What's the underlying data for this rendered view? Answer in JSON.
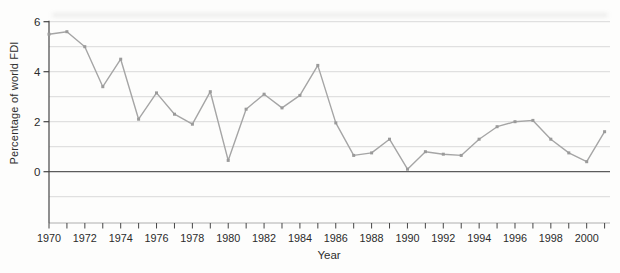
{
  "figure": {
    "background": "#fdfdfc"
  },
  "chart_data": {
    "type": "line",
    "title": "",
    "xlabel": "Year",
    "ylabel": "Percentage of world FDI",
    "x": [
      1970,
      1971,
      1972,
      1973,
      1974,
      1975,
      1976,
      1977,
      1978,
      1979,
      1980,
      1981,
      1982,
      1983,
      1984,
      1985,
      1986,
      1987,
      1988,
      1989,
      1990,
      1991,
      1992,
      1993,
      1994,
      1995,
      1996,
      1997,
      1998,
      1999,
      2000,
      2001
    ],
    "values": [
      5.5,
      5.6,
      5.0,
      3.4,
      4.5,
      2.1,
      3.15,
      2.3,
      1.9,
      3.2,
      0.45,
      2.5,
      3.1,
      2.55,
      3.05,
      4.25,
      1.95,
      0.65,
      0.75,
      1.3,
      0.1,
      0.8,
      0.7,
      0.65,
      1.3,
      1.8,
      2.0,
      2.05,
      1.3,
      0.75,
      0.4,
      1.6
    ],
    "xlim": [
      1970,
      2001
    ],
    "ylim": [
      -2.05,
      6
    ],
    "x_ticks": [
      {
        "year": 1970,
        "label": "1970"
      },
      {
        "year": 1972,
        "label": "1972"
      },
      {
        "year": 1974,
        "label": "1974"
      },
      {
        "year": 1976,
        "label": "1976"
      },
      {
        "year": 1978,
        "label": "1978"
      },
      {
        "year": 1980,
        "label": "1980"
      },
      {
        "year": 1982,
        "label": "1982"
      },
      {
        "year": 1984,
        "label": "1984"
      },
      {
        "year": 1986,
        "label": "1986"
      },
      {
        "year": 1988,
        "label": "1988"
      },
      {
        "year": 1990,
        "label": "1990"
      },
      {
        "year": 1992,
        "label": "1992"
      },
      {
        "year": 1994,
        "label": "1994"
      },
      {
        "year": 1996,
        "label": "1996"
      },
      {
        "year": 1998,
        "label": "1998"
      },
      {
        "year": 2000,
        "label": "2000"
      }
    ],
    "y_ticks": [
      {
        "value": 6,
        "label": "6"
      },
      {
        "value": 4,
        "label": "4"
      },
      {
        "value": 2,
        "label": "2"
      },
      {
        "value": 0,
        "label": "0"
      }
    ],
    "y_gridlines": [
      6,
      5,
      4,
      3,
      2,
      1,
      0,
      -1
    ],
    "grid": "horizontal",
    "legend": "none",
    "marker": "square",
    "colors": {
      "line": "#a5a5a5",
      "marker": "#9a9a9a",
      "grid": "#d9d9d9",
      "zero_line": "#5c5c5c",
      "axis": "#454545",
      "baseline": "#aeaeae",
      "text": "#2b2b2b"
    }
  }
}
